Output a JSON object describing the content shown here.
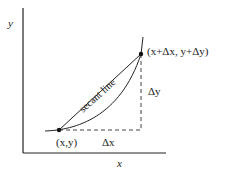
{
  "diagram": {
    "axes": {
      "x_label": "x",
      "y_label": "y"
    },
    "labels": {
      "secant": "secant line",
      "point_start": "(x,y)",
      "point_end": "(x+Δx, y+Δy)",
      "delta_x": "Δx",
      "delta_y": "Δy"
    },
    "colors": {
      "stroke": "#222222",
      "dash": "#444444",
      "background": "#ffffff"
    }
  }
}
